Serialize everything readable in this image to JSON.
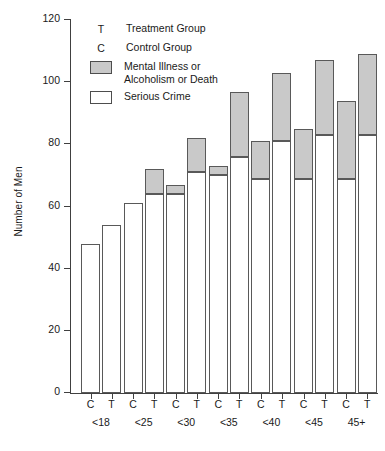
{
  "chart_data": {
    "type": "bar",
    "title": "",
    "xlabel": "",
    "ylabel": "Number of Men",
    "ylim": [
      0,
      120
    ],
    "yticks": [
      0,
      20,
      40,
      60,
      80,
      100,
      120
    ],
    "grid": false,
    "stacked": true,
    "legend_position": "top-left",
    "categories": [
      "<18",
      "<25",
      "<30",
      "<35",
      "<40",
      "<45",
      "45+"
    ],
    "group_keys": [
      "C",
      "T"
    ],
    "segment_names": [
      "Serious Crime",
      "Mental Illness or Alcoholism or Death"
    ],
    "segment_colors": [
      "#ffffff",
      "#c9c9c9"
    ],
    "groups": [
      {
        "category": "<18",
        "bars": [
          {
            "key": "C",
            "label": "C",
            "serious_crime": 48,
            "mental_illness": 0,
            "total": 48
          },
          {
            "key": "T",
            "label": "T",
            "serious_crime": 54,
            "mental_illness": 0,
            "total": 54
          }
        ]
      },
      {
        "category": "<25",
        "bars": [
          {
            "key": "C",
            "label": "C",
            "serious_crime": 61,
            "mental_illness": 0,
            "total": 61
          },
          {
            "key": "T",
            "label": "T",
            "serious_crime": 64,
            "mental_illness": 8,
            "total": 72
          }
        ]
      },
      {
        "category": "<30",
        "bars": [
          {
            "key": "C",
            "label": "C",
            "serious_crime": 64,
            "mental_illness": 3,
            "total": 67
          },
          {
            "key": "T",
            "label": "T",
            "serious_crime": 71,
            "mental_illness": 11,
            "total": 82
          }
        ]
      },
      {
        "category": "<35",
        "bars": [
          {
            "key": "C",
            "label": "C",
            "serious_crime": 70,
            "mental_illness": 3,
            "total": 73
          },
          {
            "key": "T",
            "label": "T",
            "serious_crime": 76,
            "mental_illness": 21,
            "total": 97
          }
        ]
      },
      {
        "category": "<40",
        "bars": [
          {
            "key": "C",
            "label": "C",
            "serious_crime": 69,
            "mental_illness": 12,
            "total": 81
          },
          {
            "key": "T",
            "label": "T",
            "serious_crime": 81,
            "mental_illness": 22,
            "total": 103
          }
        ]
      },
      {
        "category": "<45",
        "bars": [
          {
            "key": "C",
            "label": "C",
            "serious_crime": 69,
            "mental_illness": 16,
            "total": 85
          },
          {
            "key": "T",
            "label": "T",
            "serious_crime": 83,
            "mental_illness": 24,
            "total": 107
          }
        ]
      },
      {
        "category": "45+",
        "bars": [
          {
            "key": "C",
            "label": "C",
            "serious_crime": 69,
            "mental_illness": 25,
            "total": 94
          },
          {
            "key": "T",
            "label": "T",
            "serious_crime": 83,
            "mental_illness": 26,
            "total": 109
          }
        ]
      }
    ]
  },
  "axis": {
    "y_title": "Number of Men",
    "y_tick_labels": [
      "0",
      "20",
      "40",
      "60",
      "80",
      "100",
      "120"
    ]
  },
  "legend": {
    "items": [
      {
        "kind": "key",
        "key": "T",
        "line1": "Treatment Group",
        "line2": ""
      },
      {
        "kind": "key",
        "key": "C",
        "line1": "Control Group",
        "line2": ""
      },
      {
        "kind": "swatch",
        "swatch": "mental",
        "line1": "Mental Illness or",
        "line2": "Alcoholism or Death"
      },
      {
        "kind": "swatch",
        "swatch": "crime",
        "line1": "Serious Crime",
        "line2": ""
      }
    ]
  },
  "colors": {
    "mental_illness": "#c9c9c9",
    "serious_crime": "#ffffff",
    "axis": "#404040",
    "bar_border": "#595959"
  }
}
